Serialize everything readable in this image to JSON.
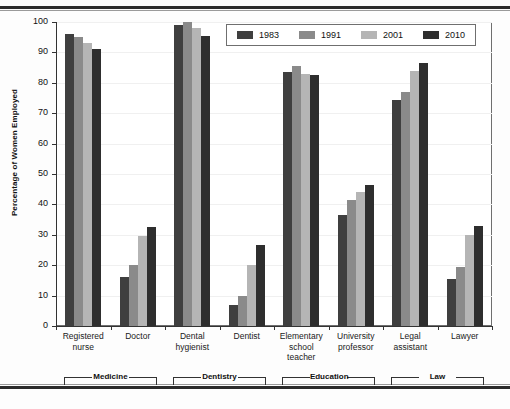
{
  "chart_data": {
    "type": "bar",
    "title": "",
    "xlabel": "",
    "ylabel": "Percentage of Women Employed",
    "ylim": [
      0,
      100
    ],
    "ytick_step": 10,
    "yticks": [
      0,
      10,
      20,
      30,
      40,
      50,
      60,
      70,
      80,
      90,
      100
    ],
    "grid": true,
    "legend_position": "top-right",
    "categories": [
      "Registered nurse",
      "Doctor",
      "Dental hygienist",
      "Dentist",
      "Elementary school teacher",
      "University professor",
      "Legal assistant",
      "Lawyer"
    ],
    "category_lines": [
      [
        "Registered",
        "nurse"
      ],
      [
        "Doctor"
      ],
      [
        "Dental",
        "hygienist"
      ],
      [
        "Dentist"
      ],
      [
        "Elementary",
        "school",
        "teacher"
      ],
      [
        "University",
        "professor"
      ],
      [
        "Legal",
        "assistant"
      ],
      [
        "Lawyer"
      ]
    ],
    "series": [
      {
        "name": "1983",
        "color": "#3f3f3f",
        "values": [
          96,
          16,
          99,
          7,
          83.5,
          36.5,
          74.5,
          15.5
        ]
      },
      {
        "name": "1991",
        "color": "#8a8a8a",
        "values": [
          95,
          20,
          100,
          10,
          85.5,
          41.5,
          77,
          19.5
        ]
      },
      {
        "name": "2001",
        "color": "#b5b5b5",
        "values": [
          93,
          29.5,
          98,
          20,
          83,
          44,
          84,
          30
        ]
      },
      {
        "name": "2010",
        "color": "#2e2e2e",
        "values": [
          91,
          32.5,
          95.5,
          26.5,
          82.5,
          46.5,
          86.5,
          33
        ]
      }
    ],
    "group_brackets": [
      {
        "label": "Medicine",
        "start_category": 0,
        "end_category": 1
      },
      {
        "label": "Dentistry",
        "start_category": 2,
        "end_category": 3
      },
      {
        "label": "Education",
        "start_category": 4,
        "end_category": 5
      },
      {
        "label": "Law",
        "start_category": 6,
        "end_category": 7
      }
    ]
  },
  "legend": {
    "items": [
      {
        "label": "1983",
        "color": "#3f3f3f"
      },
      {
        "label": "1991",
        "color": "#8a8a8a"
      },
      {
        "label": "2001",
        "color": "#b5b5b5"
      },
      {
        "label": "2010",
        "color": "#2e2e2e"
      }
    ]
  }
}
